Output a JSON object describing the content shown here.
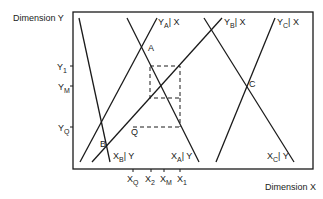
{
  "axes": {
    "y_label": "Dimension  Y",
    "x_label": "Dimension X"
  },
  "y_ticks": [
    {
      "main": "Y",
      "sub": "1"
    },
    {
      "main": "Y",
      "sub": "M"
    },
    {
      "main": "Y",
      "sub": "Q"
    }
  ],
  "x_ticks": [
    {
      "main": "X",
      "sub": "Q"
    },
    {
      "main": "X",
      "sub": "2"
    },
    {
      "main": "X",
      "sub": "M"
    },
    {
      "main": "X",
      "sub": "1"
    }
  ],
  "line_labels": {
    "ya_x": {
      "main": "Y",
      "sub": "A",
      "rest": "| X"
    },
    "yb_x": {
      "main": "Y",
      "sub": "B",
      "rest": "| X"
    },
    "yc_x": {
      "main": "Y",
      "sub": "C",
      "rest": "| X"
    },
    "xb_y": {
      "main": "X",
      "sub": "B",
      "rest": "| Y"
    },
    "xa_y": {
      "main": "X",
      "sub": "A",
      "rest": "| Y"
    },
    "xc_y": {
      "main": "X",
      "sub": "C",
      "rest": "| Y"
    }
  },
  "points": {
    "a": "A",
    "b": "B",
    "c": "C",
    "q": "Q"
  },
  "colors": {
    "line": "#1a1a1a",
    "background": "#ffffff"
  }
}
